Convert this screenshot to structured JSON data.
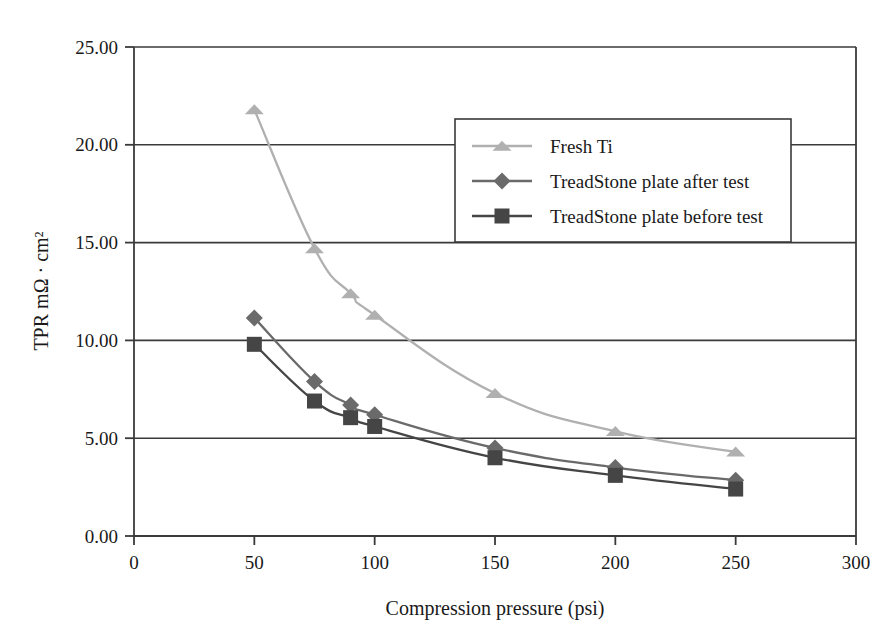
{
  "chart_data": {
    "type": "line",
    "title": "",
    "subtitle": "",
    "xlabel": "Compression pressure (psi)",
    "ylabel": "TPR mΩ · cm²",
    "xlim": [
      0,
      300
    ],
    "ylim": [
      0,
      25
    ],
    "xticks": [
      0,
      50,
      100,
      150,
      200,
      250,
      300
    ],
    "xtick_labels": [
      "0",
      "50",
      "100",
      "150",
      "200",
      "250",
      "300"
    ],
    "yticks": [
      0,
      5,
      10,
      15,
      20,
      25
    ],
    "ytick_labels": [
      "0.00",
      "5.00",
      "10.00",
      "15.00",
      "20.00",
      "25.00"
    ],
    "grid": "horizontal",
    "legend_position": "upper-right-inside",
    "series": [
      {
        "name": "Fresh Ti",
        "marker": "triangle",
        "color": "#b0b0b0",
        "x": [
          50,
          75,
          90,
          100,
          150,
          200,
          250
        ],
        "values": [
          21.8,
          14.7,
          12.4,
          11.3,
          7.3,
          5.35,
          4.3
        ]
      },
      {
        "name": "TreadStone plate after test",
        "marker": "diamond",
        "color": "#6a6a6a",
        "x": [
          50,
          75,
          90,
          100,
          150,
          200,
          250
        ],
        "values": [
          11.15,
          7.9,
          6.7,
          6.2,
          4.5,
          3.5,
          2.85
        ]
      },
      {
        "name": "TreadStone plate before test",
        "marker": "square",
        "color": "#454545",
        "x": [
          50,
          75,
          90,
          100,
          150,
          200,
          250
        ],
        "values": [
          9.8,
          6.9,
          6.05,
          5.6,
          4.0,
          3.1,
          2.4
        ]
      }
    ]
  },
  "legend": {
    "entries": [
      {
        "label": "Fresh Ti"
      },
      {
        "label": "TreadStone plate after test"
      },
      {
        "label": "TreadStone plate before test"
      }
    ]
  },
  "axes": {
    "x_title": "Compression pressure (psi)",
    "y_title": "TPR mΩ · cm²"
  },
  "colors": {
    "fresh_ti": "#b0b0b0",
    "after_test": "#6a6a6a",
    "before_test": "#454545",
    "axis": "#3a3a3a",
    "background": "#ffffff"
  }
}
